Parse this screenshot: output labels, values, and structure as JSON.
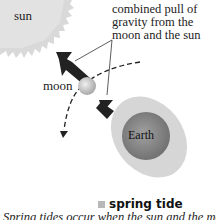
{
  "diagram": {
    "labels": {
      "sun": "sun",
      "moon": "moon",
      "earth": "Earth",
      "combined_pull": [
        "combined pull of",
        "gravity from the",
        "moon and the sun"
      ]
    },
    "legend": {
      "label": "spring tide",
      "swatch_color": "#b8b8b8"
    },
    "caption": "Spring tides occur when the sun and the moon",
    "colors": {
      "sun": "#d9d9d9",
      "earth": "#8a8a8a",
      "tidal_bulge": "#d4d4d4",
      "moon": "#cfcfcf",
      "arrow": "#222222"
    }
  }
}
